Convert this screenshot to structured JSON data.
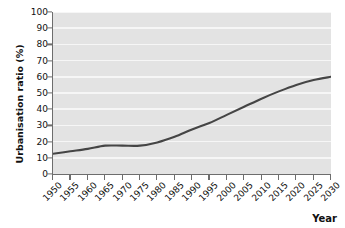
{
  "chart_data": {
    "type": "line",
    "title": "",
    "subtitle": "",
    "xlabel": "Year",
    "ylabel": "Urbanisation ratio (%)",
    "x": [
      1950,
      1955,
      1960,
      1965,
      1970,
      1975,
      1980,
      1985,
      1990,
      1995,
      2000,
      2005,
      2010,
      2015,
      2020,
      2025,
      2030
    ],
    "xtick_labels": [
      "1950",
      "1955",
      "1960",
      "1965",
      "1970",
      "1975",
      "1980",
      "1985",
      "1990",
      "1995",
      "2000",
      "2005",
      "2010",
      "2015",
      "2020",
      "2025",
      "2030"
    ],
    "ytick_labels": [
      "0",
      "10",
      "20",
      "30",
      "40",
      "50",
      "60",
      "70",
      "80",
      "90",
      "100"
    ],
    "ytick_values": [
      0,
      10,
      20,
      30,
      40,
      50,
      60,
      70,
      80,
      90,
      100
    ],
    "xlim": [
      1950,
      2030
    ],
    "ylim": [
      0,
      100
    ],
    "grid": "horizontal",
    "legend": "none",
    "series": [
      {
        "name": "Urbanisation ratio",
        "color": "#454545",
        "values": [
          12.5,
          14.0,
          15.5,
          17.5,
          17.5,
          17.5,
          19.5,
          23.0,
          27.5,
          31.5,
          36.5,
          41.5,
          46.5,
          51.0,
          55.0,
          58.0,
          60.0
        ]
      }
    ]
  },
  "axes": {
    "plot_background": "#e3e3e3",
    "gridline_color": "#f6f6f6",
    "axis_color": "#6d6d6d"
  }
}
